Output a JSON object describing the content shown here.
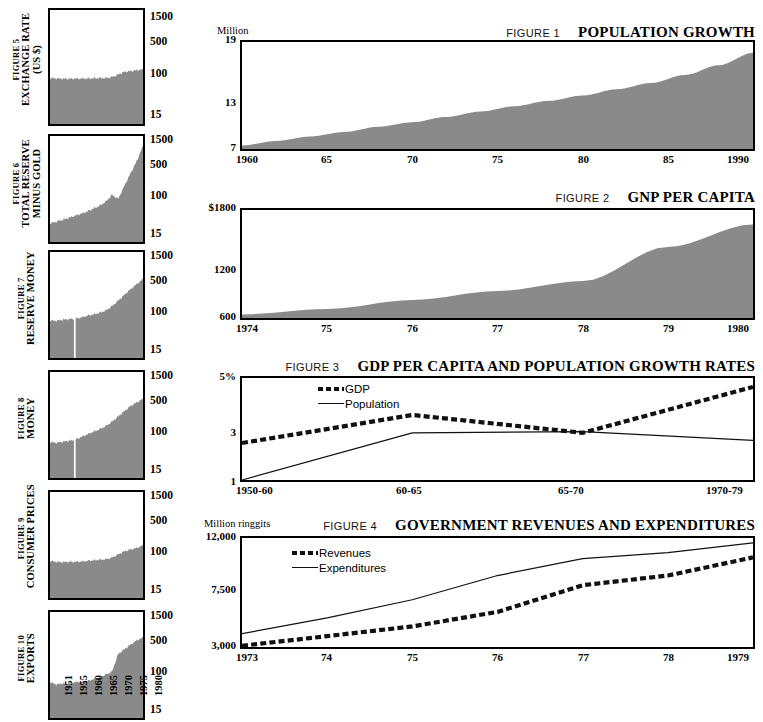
{
  "page": {
    "background": "#ffffff",
    "ink": "#000000",
    "fill_gray": "#8a8a8a"
  },
  "left_column": {
    "y_ticks": [
      "1500",
      "500",
      "100",
      "15"
    ],
    "x_years": [
      "1951",
      "1955",
      "1960",
      "1965",
      "1970",
      "1975",
      "1980"
    ],
    "charts": [
      {
        "figure_no": "FIGURE 5",
        "name": "EXCHANGE RATE",
        "name2": "(US $)",
        "chart_data": {
          "type": "area",
          "title": "EXCHANGE RATE (US $)",
          "ylabel": "",
          "xlabel": "",
          "yscale": "log",
          "yticks": [
            15,
            100,
            500,
            1500
          ],
          "ylim": [
            10,
            2200
          ],
          "x": [
            1951,
            1953,
            1955,
            1957,
            1959,
            1961,
            1963,
            1965,
            1967,
            1969,
            1971,
            1973,
            1975,
            1977,
            1979,
            1981
          ],
          "values": [
            88,
            86,
            85,
            85,
            86,
            86,
            86,
            87,
            88,
            88,
            92,
            104,
            118,
            122,
            128,
            132
          ]
        }
      },
      {
        "figure_no": "FIGURE 6",
        "name": "TOTAL RESERVE",
        "name2": "MINUS GOLD",
        "chart_data": {
          "type": "area",
          "title": "TOTAL RESERVE MINUS GOLD",
          "yscale": "log",
          "yticks": [
            15,
            100,
            500,
            1500
          ],
          "ylim": [
            10,
            2200
          ],
          "x": [
            1951,
            1953,
            1955,
            1957,
            1959,
            1961,
            1963,
            1965,
            1967,
            1969,
            1971,
            1973,
            1975,
            1977,
            1979,
            1981
          ],
          "values": [
            26,
            28,
            31,
            34,
            38,
            42,
            47,
            55,
            63,
            78,
            110,
            90,
            175,
            330,
            620,
            1350
          ]
        }
      },
      {
        "figure_no": "FIGURE 7",
        "name": "RESERVE MONEY",
        "name2": "",
        "chart_data": {
          "type": "area",
          "title": "RESERVE MONEY",
          "yscale": "log",
          "yticks": [
            15,
            100,
            500,
            1500
          ],
          "ylim": [
            10,
            2200
          ],
          "break_at": 1959,
          "x": [
            1951,
            1953,
            1955,
            1957,
            1959,
            1961,
            1963,
            1965,
            1967,
            1969,
            1971,
            1973,
            1975,
            1977,
            1979,
            1981
          ],
          "values": [
            68,
            66,
            70,
            72,
            74,
            78,
            86,
            92,
            100,
            112,
            140,
            185,
            250,
            330,
            430,
            560
          ]
        }
      },
      {
        "figure_no": "FIGURE 8",
        "name": "MONEY",
        "name2": "",
        "chart_data": {
          "type": "area",
          "title": "MONEY",
          "yscale": "log",
          "yticks": [
            15,
            100,
            500,
            1500
          ],
          "ylim": [
            10,
            2200
          ],
          "break_at": 1959,
          "x": [
            1951,
            1953,
            1955,
            1957,
            1959,
            1961,
            1963,
            1965,
            1967,
            1969,
            1971,
            1973,
            1975,
            1977,
            1979,
            1981
          ],
          "values": [
            62,
            60,
            63,
            66,
            70,
            80,
            92,
            105,
            120,
            140,
            175,
            230,
            300,
            390,
            470,
            560
          ]
        }
      },
      {
        "figure_no": "FIGURE 9",
        "name": "CONSUMER PRICES",
        "name2": "",
        "chart_data": {
          "type": "area",
          "title": "CONSUMER PRICES",
          "yscale": "log",
          "yticks": [
            15,
            100,
            500,
            1500
          ],
          "ylim": [
            10,
            2200
          ],
          "x": [
            1951,
            1953,
            1955,
            1957,
            1959,
            1961,
            1963,
            1965,
            1967,
            1969,
            1971,
            1973,
            1975,
            1977,
            1979,
            1981
          ],
          "values": [
            66,
            63,
            62,
            63,
            63,
            64,
            66,
            68,
            70,
            72,
            78,
            92,
            108,
            118,
            128,
            145
          ]
        }
      },
      {
        "figure_no": "FIGURE 10",
        "name": "EXPORTS",
        "name2": "",
        "chart_data": {
          "type": "area",
          "title": "EXPORTS",
          "yscale": "log",
          "yticks": [
            15,
            100,
            500,
            1500
          ],
          "ylim": [
            10,
            2200
          ],
          "x": [
            1951,
            1953,
            1955,
            1957,
            1959,
            1961,
            1963,
            1965,
            1967,
            1969,
            1971,
            1973,
            1975,
            1977,
            1979,
            1981
          ],
          "values": [
            62,
            55,
            58,
            56,
            62,
            63,
            66,
            72,
            78,
            92,
            105,
            260,
            330,
            420,
            520,
            600
          ]
        }
      }
    ]
  },
  "figures": [
    {
      "figure_no": "FIGURE 1",
      "title": "POPULATION GROWTH",
      "unit": "Million",
      "y_ticks": [
        "19",
        "13",
        "7"
      ],
      "x_ticks": [
        "1960",
        "65",
        "70",
        "75",
        "80",
        "85",
        "1990"
      ],
      "chart_data": {
        "type": "area",
        "title": "POPULATION GROWTH",
        "ylabel": "Million",
        "xlabel": "",
        "ylim": [
          7,
          19
        ],
        "yticks": [
          7,
          13,
          19
        ],
        "x": [
          1960,
          1962,
          1964,
          1966,
          1968,
          1970,
          1972,
          1974,
          1976,
          1978,
          1980,
          1982,
          1984,
          1986,
          1988,
          1990
        ],
        "values": [
          7.4,
          7.9,
          8.4,
          8.9,
          9.5,
          10.0,
          10.6,
          11.2,
          11.8,
          12.4,
          13.0,
          13.7,
          14.4,
          15.3,
          16.4,
          17.8
        ]
      }
    },
    {
      "figure_no": "FIGURE 2",
      "title": "GNP PER CAPITA",
      "unit": "",
      "y_ticks": [
        "$1800",
        "1200",
        "600"
      ],
      "x_ticks": [
        "1974",
        "75",
        "76",
        "77",
        "78",
        "79",
        "1980"
      ],
      "chart_data": {
        "type": "area",
        "title": "GNP PER CAPITA",
        "ylabel": "$",
        "xlabel": "",
        "ylim": [
          600,
          1800
        ],
        "yticks": [
          600,
          1200,
          1800
        ],
        "x": [
          1974,
          1975,
          1976,
          1977,
          1978,
          1979,
          1980
        ],
        "values": [
          640,
          700,
          800,
          900,
          1010,
          1390,
          1640
        ]
      }
    },
    {
      "figure_no": "FIGURE 3",
      "title": "GDP PER CAPITA AND POPULATION GROWTH RATES",
      "unit": "",
      "y_ticks": [
        "5%",
        "3",
        "1"
      ],
      "x_ticks": [
        "1950-60",
        "60-65",
        "65-70",
        "1970-79"
      ],
      "legend": [
        "GDP",
        "Population"
      ],
      "chart_data": {
        "type": "line",
        "title": "GDP PER CAPITA AND POPULATION GROWTH RATES",
        "ylabel": "%",
        "xlabel": "",
        "ylim": [
          1,
          5
        ],
        "yticks": [
          1,
          3,
          5
        ],
        "categories": [
          "1950-60",
          "60-65",
          "65-70",
          "1970-79"
        ],
        "series": [
          {
            "name": "GDP",
            "style": "dashed",
            "values": [
              2.45,
              3.55,
              2.85,
              4.65
            ]
          },
          {
            "name": "Population",
            "style": "solid",
            "values": [
              1.0,
              2.85,
              2.9,
              2.55
            ]
          }
        ]
      }
    },
    {
      "figure_no": "FIGURE 4",
      "title": "GOVERNMENT REVENUES AND EXPENDITURES",
      "unit": "Million ringgits",
      "y_ticks": [
        "12,000",
        "7,500",
        "3,000"
      ],
      "x_ticks": [
        "1973",
        "74",
        "75",
        "76",
        "77",
        "78",
        "1979"
      ],
      "legend": [
        "Revenues",
        "Expenditures"
      ],
      "chart_data": {
        "type": "line",
        "title": "GOVERNMENT REVENUES AND EXPENDITURES",
        "ylabel": "Million ringgits",
        "xlabel": "",
        "ylim": [
          3000,
          12000
        ],
        "yticks": [
          3000,
          7500,
          12000
        ],
        "categories": [
          "1973",
          "74",
          "75",
          "76",
          "77",
          "78",
          "1979"
        ],
        "series": [
          {
            "name": "Revenues",
            "style": "dashed",
            "values": [
              3100,
              3900,
              4700,
              5900,
              8100,
              8900,
              10400
            ]
          },
          {
            "name": "Expenditures",
            "style": "solid",
            "values": [
              4100,
              5400,
              6900,
              8900,
              10300,
              10800,
              11600
            ]
          }
        ]
      }
    }
  ]
}
